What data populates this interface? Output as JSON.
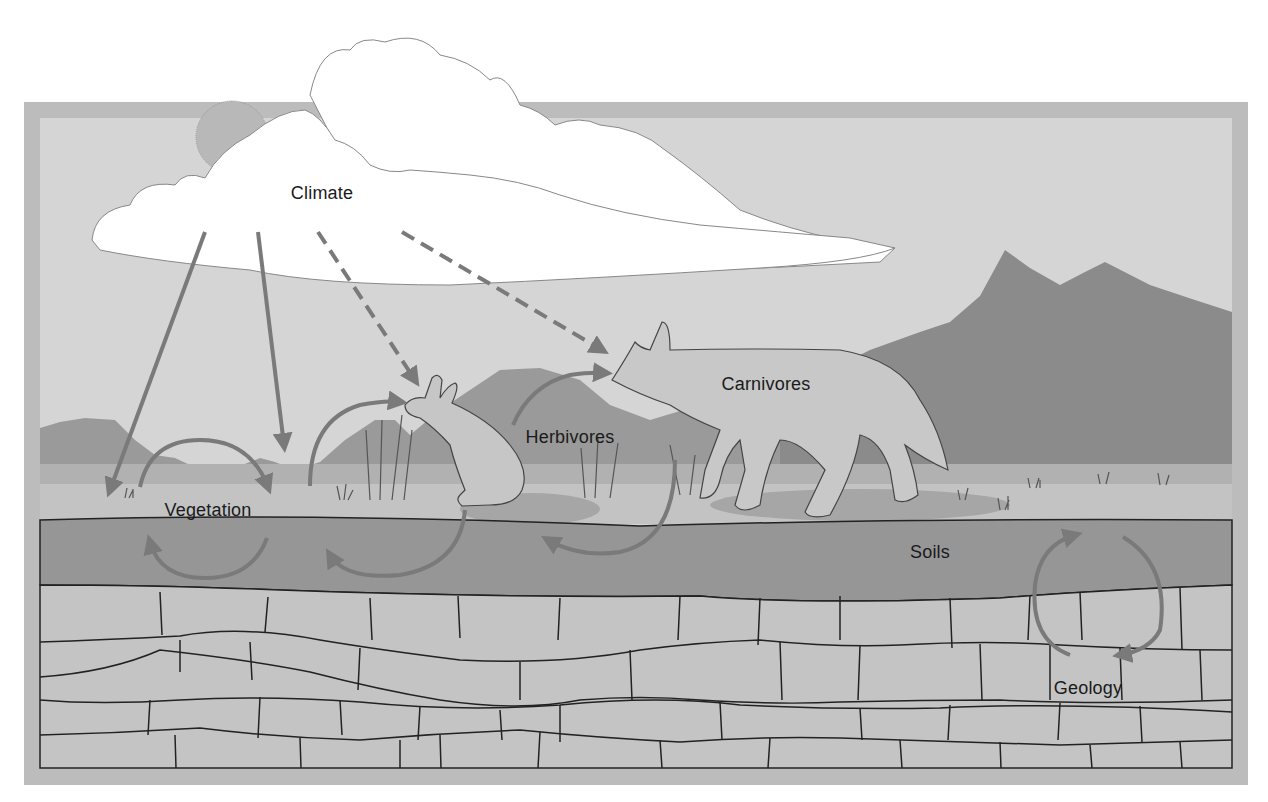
{
  "diagram": {
    "type": "ecosystem-interaction-diagram",
    "labels": {
      "climate": "Climate",
      "vegetation": "Vegetation",
      "herbivores": "Herbivores",
      "carnivores": "Carnivores",
      "soils": "Soils",
      "geology": "Geology"
    },
    "nodes": [
      {
        "id": "climate",
        "label": "Climate",
        "depicted_as": "cloud with sun"
      },
      {
        "id": "vegetation",
        "label": "Vegetation",
        "depicted_as": "grassland"
      },
      {
        "id": "herbivores",
        "label": "Herbivores",
        "depicted_as": "rabbit"
      },
      {
        "id": "carnivores",
        "label": "Carnivores",
        "depicted_as": "coyote"
      },
      {
        "id": "soils",
        "label": "Soils",
        "depicted_as": "soil layer"
      },
      {
        "id": "geology",
        "label": "Geology",
        "depicted_as": "bedrock layers"
      }
    ],
    "edges": [
      {
        "from": "climate",
        "to": "vegetation",
        "style": "solid",
        "count": 2
      },
      {
        "from": "climate",
        "to": "herbivores",
        "style": "dashed"
      },
      {
        "from": "climate",
        "to": "carnivores",
        "style": "dashed"
      },
      {
        "from": "vegetation",
        "to": "soils",
        "style": "cycle"
      },
      {
        "from": "soils",
        "to": "vegetation",
        "style": "cycle"
      },
      {
        "from": "vegetation",
        "to": "herbivores",
        "style": "curved"
      },
      {
        "from": "herbivores",
        "to": "soils",
        "style": "curved"
      },
      {
        "from": "herbivores",
        "to": "carnivores",
        "style": "curved"
      },
      {
        "from": "carnivores",
        "to": "soils",
        "style": "curved"
      },
      {
        "from": "geology",
        "to": "soils",
        "style": "cycle"
      },
      {
        "from": "soils",
        "to": "geology",
        "style": "cycle"
      }
    ],
    "colors": {
      "frame": "#bcbcbc",
      "sky": "#d5d5d5",
      "cloud": "#ffffff",
      "sun": "#b8b8b8",
      "mountains": "#8b8b8b",
      "hills": "#9a9a9a",
      "grass_band": "#b1b1b1",
      "ground": "#c3c3c3",
      "soil": "#969696",
      "rock": "#c4c4c4",
      "arrow": "#7a7a7a",
      "outline": "#222222"
    }
  }
}
